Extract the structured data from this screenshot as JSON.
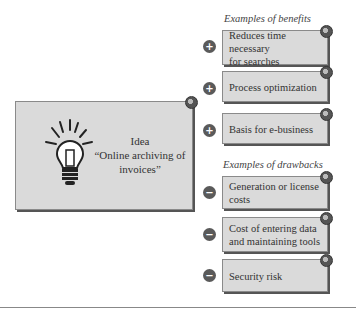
{
  "idea": {
    "title": "Idea",
    "line2": "“Online archiving of",
    "line3": "invoices”",
    "icon": "lightbulb-icon"
  },
  "benefits": {
    "heading": "Examples of benefits",
    "items": [
      {
        "line1": "Reduces time necessary",
        "line2": "for searches",
        "sign": "+"
      },
      {
        "line1": "Process optimization",
        "line2": "",
        "sign": "+"
      },
      {
        "line1": "Basis for e-business",
        "line2": "",
        "sign": "+"
      }
    ]
  },
  "drawbacks": {
    "heading": "Examples of drawbacks",
    "items": [
      {
        "line1": "Generation or license",
        "line2": "costs",
        "sign": "−"
      },
      {
        "line1": "Cost of entering data",
        "line2": "and maintaining tools",
        "sign": "−"
      },
      {
        "line1": "Security risk",
        "line2": "",
        "sign": "−"
      }
    ]
  },
  "colors": {
    "box_fill": "#dadada",
    "sign_fill": "#5a5a5a",
    "border": "#8a8a8a"
  }
}
